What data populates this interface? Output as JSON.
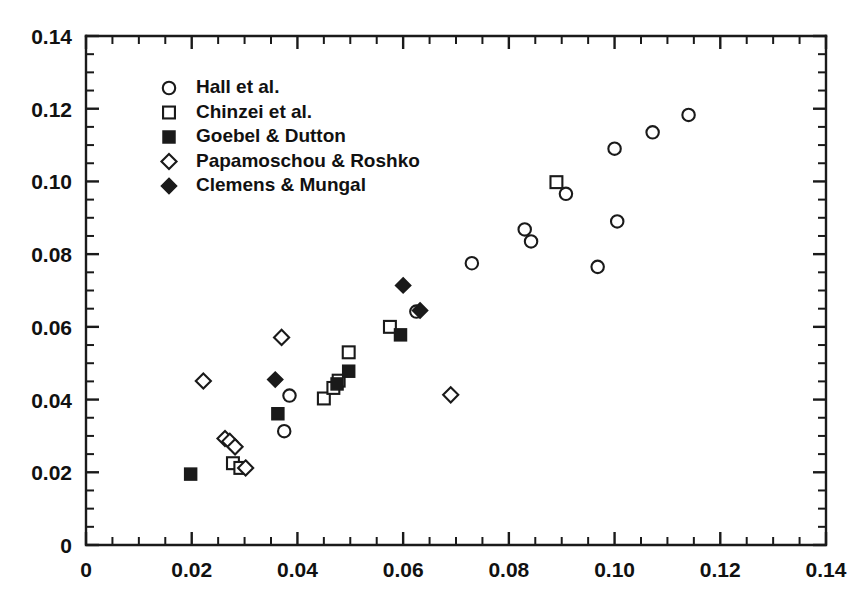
{
  "chart_data": {
    "type": "scatter",
    "title": "",
    "subtitle": "",
    "xlabel": "",
    "ylabel": "",
    "xlim": [
      0,
      0.14
    ],
    "ylim": [
      0,
      0.14
    ],
    "xticks": [
      0,
      0.02,
      0.04,
      0.06,
      0.08,
      0.1,
      0.12,
      0.14
    ],
    "yticks": [
      0,
      0.02,
      0.04,
      0.06,
      0.08,
      0.1,
      0.12,
      0.14
    ],
    "xticklabels": [
      "0",
      "0.02",
      "0.04",
      "0.06",
      "0.08",
      "0.10",
      "0.12",
      "0.14"
    ],
    "yticklabels": [
      "0",
      "0.02",
      "0.04",
      "0.06",
      "0.08",
      "0.10",
      "0.12",
      "0.14"
    ],
    "minor_tick_interval": 0.005,
    "grid": false,
    "legend_position": "upper-left-inside",
    "series": [
      {
        "name": "Hall et al.",
        "marker": "circle-open",
        "filled": false,
        "points": [
          [
            0.0375,
            0.0313
          ],
          [
            0.0385,
            0.0411
          ],
          [
            0.0625,
            0.0642
          ],
          [
            0.073,
            0.0775
          ],
          [
            0.083,
            0.0868
          ],
          [
            0.0842,
            0.0835
          ],
          [
            0.0908,
            0.0966
          ],
          [
            0.0968,
            0.0765
          ],
          [
            0.1,
            0.109
          ],
          [
            0.1005,
            0.089
          ],
          [
            0.1072,
            0.1135
          ],
          [
            0.114,
            0.1183
          ]
        ]
      },
      {
        "name": "Chinzei et al.",
        "marker": "square-open",
        "filled": false,
        "points": [
          [
            0.0278,
            0.0225
          ],
          [
            0.0292,
            0.0212
          ],
          [
            0.045,
            0.0403
          ],
          [
            0.0468,
            0.0432
          ],
          [
            0.0478,
            0.0452
          ],
          [
            0.0497,
            0.053
          ],
          [
            0.0575,
            0.06
          ],
          [
            0.089,
            0.0998
          ]
        ]
      },
      {
        "name": "Goebel & Dutton",
        "marker": "square-filled",
        "filled": true,
        "points": [
          [
            0.0198,
            0.0195
          ],
          [
            0.0363,
            0.0361
          ],
          [
            0.0475,
            0.0443
          ],
          [
            0.0497,
            0.0478
          ],
          [
            0.0595,
            0.0578
          ]
        ]
      },
      {
        "name": "Papamoschou & Roshko",
        "marker": "diamond-open",
        "filled": false,
        "points": [
          [
            0.0222,
            0.0451
          ],
          [
            0.0263,
            0.0293
          ],
          [
            0.0272,
            0.0285
          ],
          [
            0.0282,
            0.027
          ],
          [
            0.0302,
            0.0212
          ],
          [
            0.037,
            0.0571
          ],
          [
            0.069,
            0.0413
          ]
        ]
      },
      {
        "name": "Clemens & Mungal",
        "marker": "diamond-filled",
        "filled": true,
        "points": [
          [
            0.0358,
            0.0455
          ],
          [
            0.06,
            0.0714
          ],
          [
            0.0632,
            0.0645
          ]
        ]
      }
    ]
  },
  "legend": {
    "entries": [
      {
        "label": "Hall et al.",
        "marker": "circle-open"
      },
      {
        "label": "Chinzei et al.",
        "marker": "square-open"
      },
      {
        "label": "Goebel & Dutton",
        "marker": "square-filled"
      },
      {
        "label": "Papamoschou & Roshko",
        "marker": "diamond-open"
      },
      {
        "label": "Clemens & Mungal",
        "marker": "diamond-filled"
      }
    ]
  },
  "colors": {
    "ink": "#1a1a1a",
    "background": "#ffffff",
    "marker_fill_open": "#ffffff",
    "marker_fill_solid": "#1a1a1a"
  }
}
